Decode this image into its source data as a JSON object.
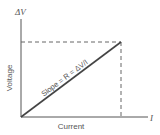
{
  "diagram": {
    "y_axis_symbol": "ΔV",
    "x_axis_symbol": "I",
    "y_axis_label": "Voltage",
    "x_axis_label": "Current",
    "line_label": "Slope = R = ΔV/I",
    "colors": {
      "axis": "#555555",
      "line": "#444444",
      "dashed": "#666666",
      "text": "#555555"
    }
  }
}
